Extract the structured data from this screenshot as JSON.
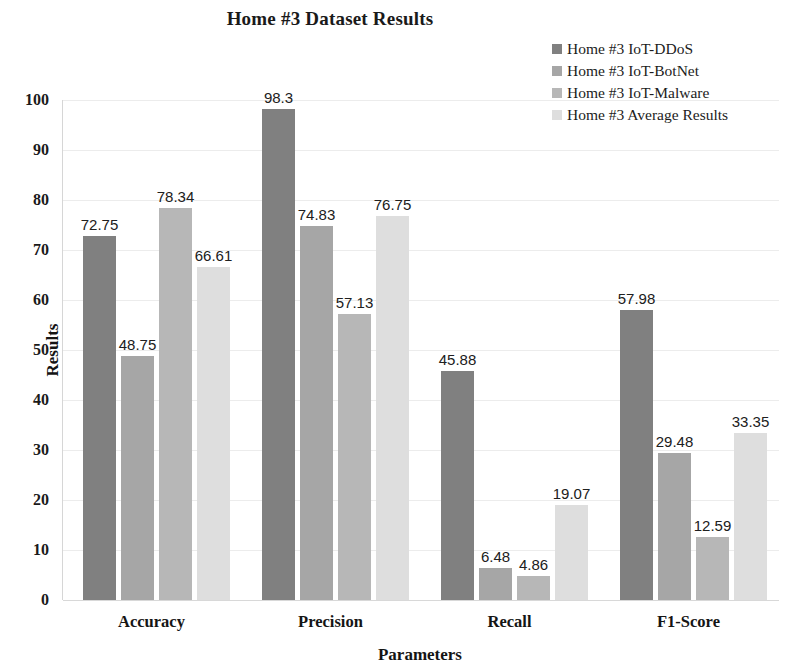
{
  "chart_data": {
    "type": "bar",
    "title": "Home #3 Dataset Results",
    "xlabel": "Parameters",
    "ylabel": "Results",
    "categories": [
      "Accuracy",
      "Precision",
      "Recall",
      "F1-Score"
    ],
    "series": [
      {
        "name": "Home #3 IoT-DDoS",
        "color": "#808080",
        "values": [
          72.75,
          98.3,
          45.88,
          57.98
        ],
        "labels": [
          "72.75",
          "98.3",
          "45.88",
          "57.98"
        ]
      },
      {
        "name": "Home #3 IoT-BotNet",
        "color": "#a6a6a6",
        "values": [
          48.75,
          74.83,
          6.48,
          29.48
        ],
        "labels": [
          "48.75",
          "74.83",
          "6.48",
          "29.48"
        ]
      },
      {
        "name": "Home #3 IoT-Malware",
        "color": "#b7b7b7",
        "values": [
          78.34,
          57.13,
          4.86,
          12.59
        ],
        "labels": [
          "78.34",
          "57.13",
          "4.86",
          "12.59"
        ]
      },
      {
        "name": "Home #3 Average Results",
        "color": "#dedede",
        "values": [
          66.61,
          76.75,
          19.07,
          33.35
        ],
        "labels": [
          "66.61",
          "76.75",
          "19.07",
          "33.35"
        ]
      }
    ],
    "ylim": [
      0,
      100
    ],
    "yticks": [
      "0",
      "10",
      "20",
      "30",
      "40",
      "50",
      "60",
      "70",
      "80",
      "90",
      "100"
    ],
    "grid": true,
    "legend_position": "top-right"
  }
}
